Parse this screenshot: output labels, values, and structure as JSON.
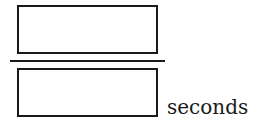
{
  "fraction": {
    "numerator": {
      "value": "",
      "placeholder": ""
    },
    "denominator": {
      "value": "",
      "placeholder": ""
    },
    "unit_label": "seconds"
  }
}
